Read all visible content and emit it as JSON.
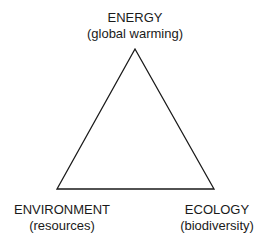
{
  "diagram": {
    "type": "triangle",
    "line_color": "#1a1a1a",
    "vertices": {
      "top": {
        "title": "ENERGY",
        "subtitle": "(global warming)"
      },
      "bottom_left": {
        "title": "ENVIRONMENT",
        "subtitle": "(resources)"
      },
      "bottom_right": {
        "title": "ECOLOGY",
        "subtitle": "(biodiversity)"
      }
    }
  }
}
